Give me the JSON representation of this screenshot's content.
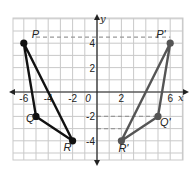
{
  "diagram": {
    "type": "coordinate-plane-reflection",
    "axis_labels": {
      "x": "x",
      "y": "y"
    },
    "x_ticks": [
      {
        "value": -6,
        "label": "-6"
      },
      {
        "value": -4,
        "label": "-4"
      },
      {
        "value": -2,
        "label": "-2"
      },
      {
        "value": 0,
        "label": "0"
      },
      {
        "value": 2,
        "label": "2"
      },
      {
        "value": 6,
        "label": "6"
      }
    ],
    "y_ticks": [
      {
        "value": 4,
        "label": "4"
      },
      {
        "value": 2,
        "label": "2"
      },
      {
        "value": -2,
        "label": "-2"
      },
      {
        "value": -4,
        "label": "-4"
      }
    ],
    "grid": {
      "xmin": -7,
      "xmax": 7,
      "ymin": -5.5,
      "ymax": 6
    },
    "triangles": [
      {
        "name": "PQR",
        "color": "#111111",
        "vertices": [
          {
            "label": "P",
            "x": -6,
            "y": 4
          },
          {
            "label": "Q",
            "x": -5,
            "y": -2
          },
          {
            "label": "R",
            "x": -2,
            "y": -4
          }
        ]
      },
      {
        "name": "P'Q'R'",
        "color": "#555555",
        "vertices": [
          {
            "label": "P'",
            "x": 6,
            "y": 4
          },
          {
            "label": "Q'",
            "x": 5,
            "y": -2
          },
          {
            "label": "R'",
            "x": 2,
            "y": -4
          }
        ]
      }
    ],
    "dashed_guides": [
      {
        "y": 4.5,
        "x_from": -5,
        "x_to": 6
      },
      {
        "y": -2,
        "x_from": 0,
        "x_to": 5
      },
      {
        "y": -3,
        "x_from": 0,
        "x_to": 2
      }
    ]
  }
}
